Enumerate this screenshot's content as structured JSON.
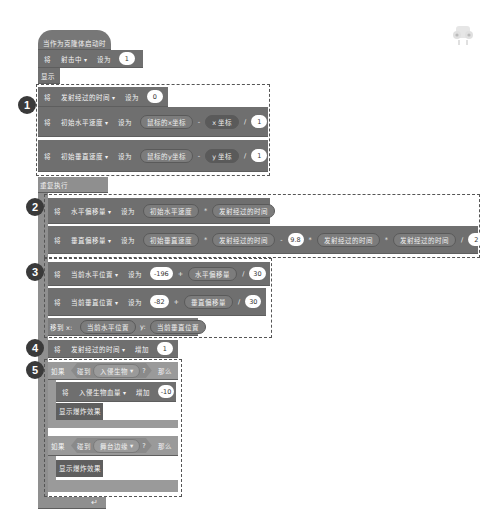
{
  "hat": {
    "label": "当作为克隆体启动时"
  },
  "rows": {
    "set_hit": {
      "kw": "将",
      "var": "射击中",
      "op": "设为",
      "value": "1"
    },
    "show": {
      "label": "显示"
    },
    "set_time": {
      "kw": "将",
      "var": "发射经过的时间",
      "op": "设为",
      "value": "0"
    },
    "set_vx": {
      "kw": "将",
      "var": "初始水平速度",
      "op": "设为",
      "a": "鼠标的x坐标",
      "minus": "-",
      "b": "x 坐标",
      "div": "/",
      "c": "1"
    },
    "set_vy": {
      "kw": "将",
      "var": "初始垂直速度",
      "op": "设为",
      "a": "鼠标的y坐标",
      "minus": "-",
      "b": "y 坐标",
      "div": "/",
      "c": "1"
    },
    "forever": {
      "label": "重复执行"
    },
    "set_dx": {
      "kw": "将",
      "var": "水平偏移量",
      "op": "设为",
      "a": "初始水平速度",
      "mul": "*",
      "b": "发射经过的时间"
    },
    "set_dy": {
      "kw": "将",
      "var": "垂直偏移量",
      "op": "设为",
      "a": "初始垂直速度",
      "mul": "*",
      "b": "发射经过的时间",
      "minus": "-",
      "g": "9.8",
      "mul2": "*",
      "t1": "发射经过的时间",
      "mul3": "*",
      "t2": "发射经过的时间",
      "div": "/",
      "d": "2"
    },
    "set_x": {
      "kw": "将",
      "var": "当前水平位置",
      "op": "设为",
      "a": "-196",
      "plus": "+",
      "b": "水平偏移量",
      "div": "/",
      "c": "30"
    },
    "set_y": {
      "kw": "将",
      "var": "当前垂直位置",
      "op": "设为",
      "a": "-82",
      "plus": "+",
      "b": "垂直偏移量",
      "div": "/",
      "c": "30"
    },
    "goto": {
      "label": "移到 x:",
      "x": "当前水平位置",
      "ylabel": "y:",
      "y": "当前垂直位置"
    },
    "inc_time": {
      "kw": "将",
      "var": "发射经过的时间",
      "op": "增加",
      "value": "1"
    },
    "if1": {
      "kw": "如果",
      "touch": "碰到",
      "target": "入侵生物",
      "q": "?",
      "then": "那么"
    },
    "dec_hp": {
      "kw": "将",
      "var": "入侵生物血量",
      "op": "增加",
      "value": "-10"
    },
    "explode1": {
      "label": "显示爆炸效果"
    },
    "if2": {
      "kw": "如果",
      "touch": "碰到",
      "target": "舞台边缘",
      "q": "?",
      "then": "那么"
    },
    "explode2": {
      "label": "显示爆炸效果"
    }
  },
  "badges": [
    "1",
    "2",
    "3",
    "4",
    "5"
  ],
  "sprite": {
    "name": "sprite-thumbnail"
  }
}
